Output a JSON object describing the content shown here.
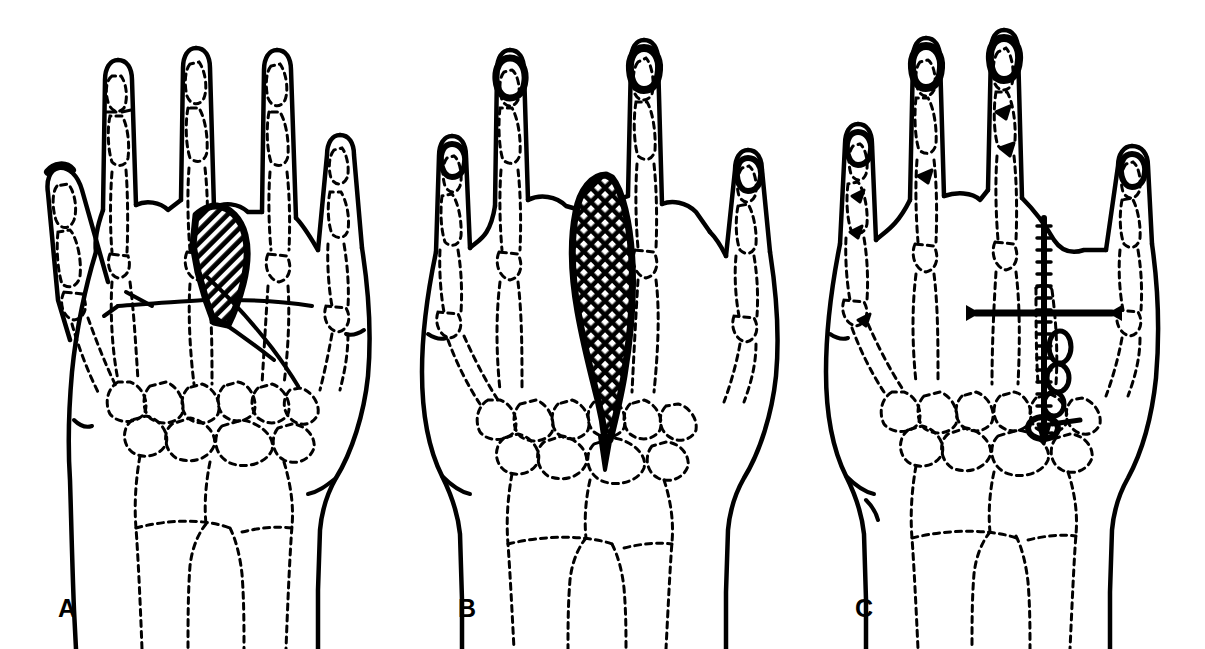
{
  "figure": {
    "background_color": "#ffffff",
    "ink_color": "#000000",
    "width": 1205,
    "height": 649,
    "panel_count": 3,
    "view": "dorsal view of right hand, skeleton shown in dashed outline"
  },
  "panels": [
    {
      "id": "A",
      "label": "A",
      "caption": "Tumor mass at base of third metacarpal with planned resection lines",
      "lesion": {
        "name": "hatched-tumor-mass",
        "shape": "dome",
        "fill_pattern": "diagonal-hatch",
        "hatch_angle_deg": 45,
        "border": "thick-solid",
        "location": "proximal third metacarpal, dorsal"
      },
      "markings": [
        {
          "name": "resection-line-proximal",
          "type": "solid-line"
        },
        {
          "name": "resection-line-distal",
          "type": "solid-line"
        },
        {
          "name": "incision-line-lateral",
          "type": "solid-line"
        }
      ],
      "digits": [
        "thumb",
        "index",
        "long",
        "ring",
        "small"
      ],
      "nail_shading": "light"
    },
    {
      "id": "B",
      "label": "B",
      "caption": "Extent of tumor involvement along the full third metacarpal shaft",
      "lesion": {
        "name": "crosshatched-tumor-mass",
        "shape": "teardrop",
        "fill_pattern": "cross-hatch",
        "hatch_angle_deg": 45,
        "border": "thick-solid",
        "location": "entire third metacarpal, tapering to carpus"
      },
      "markings": [],
      "digits": [
        "thumb",
        "index",
        "long",
        "ring",
        "small"
      ],
      "nail_shading": "dark"
    },
    {
      "id": "C",
      "label": "C",
      "caption": "Reconstruction with intramedullary rod, transverse pin and bone graft",
      "lesion": null,
      "hardware": [
        {
          "name": "intramedullary-rod",
          "type": "threaded-k-wire",
          "orientation": "longitudinal"
        },
        {
          "name": "transverse-pin",
          "type": "k-wire",
          "orientation": "transverse"
        },
        {
          "name": "bone-graft-segment-1",
          "type": "graft-block"
        },
        {
          "name": "bone-graft-segment-2",
          "type": "graft-block"
        },
        {
          "name": "bone-graft-segment-3",
          "type": "graft-block"
        },
        {
          "name": "locking-washer",
          "type": "ring"
        }
      ],
      "digits": [
        "thumb",
        "index",
        "long",
        "ring",
        "small"
      ],
      "nail_shading": "dark"
    }
  ]
}
